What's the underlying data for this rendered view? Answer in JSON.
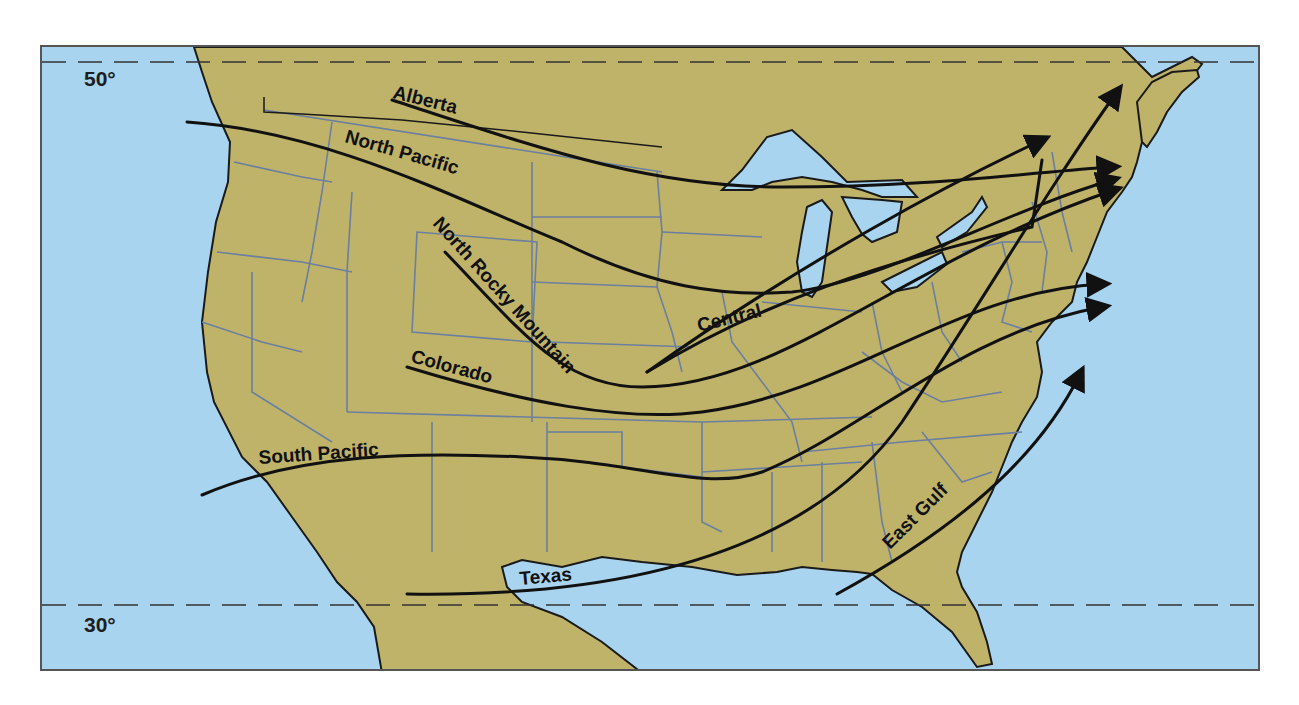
{
  "map": {
    "title": "Principal storm tracks across the United States",
    "colors": {
      "ocean": "#a9d4ef",
      "land": "#bfb36a",
      "state_border": "#6b7fa0",
      "coast": "#1a1a1a",
      "track": "#111111"
    },
    "latitude_lines": [
      {
        "label": "50°",
        "y": 60
      },
      {
        "label": "30°",
        "y": 603
      }
    ],
    "tracks": [
      {
        "name": "Alberta",
        "has_arrow": true
      },
      {
        "name": "North Pacific",
        "has_arrow": true
      },
      {
        "name": "North Rocky Mountain",
        "has_arrow": true
      },
      {
        "name": "Central",
        "has_arrow": true
      },
      {
        "name": "Colorado",
        "has_arrow": true
      },
      {
        "name": "South Pacific",
        "has_arrow": true
      },
      {
        "name": "Texas",
        "has_arrow": true
      },
      {
        "name": "East Gulf",
        "has_arrow": true
      }
    ]
  }
}
